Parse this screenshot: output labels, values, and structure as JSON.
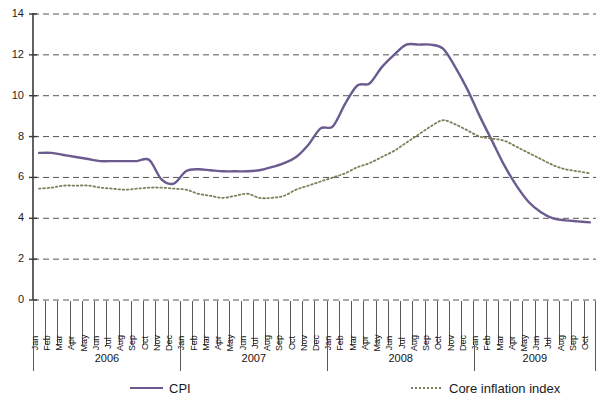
{
  "chart_data": {
    "type": "line",
    "title": "",
    "xlabel": "",
    "ylabel": "",
    "ylim": [
      0,
      14
    ],
    "yticks": [
      0,
      2,
      4,
      6,
      8,
      10,
      12,
      14
    ],
    "grid": true,
    "legend_position": "bottom",
    "months": [
      "Jan",
      "Feb",
      "Mar",
      "Apr",
      "May",
      "Jun",
      "Jul",
      "Aug",
      "Sep",
      "Oct",
      "Nov",
      "Dec"
    ],
    "year_groups": [
      {
        "label": "2006",
        "months": 12
      },
      {
        "label": "2007",
        "months": 12
      },
      {
        "label": "2008",
        "months": 12
      },
      {
        "label": "2009",
        "months": 10
      }
    ],
    "x": [
      "Jan 2006",
      "Feb 2006",
      "Mar 2006",
      "Apr 2006",
      "May 2006",
      "Jun 2006",
      "Jul 2006",
      "Aug 2006",
      "Sep 2006",
      "Oct 2006",
      "Nov 2006",
      "Dec 2006",
      "Jan 2007",
      "Feb 2007",
      "Mar 2007",
      "Apr 2007",
      "May 2007",
      "Jun 2007",
      "Jul 2007",
      "Aug 2007",
      "Sep 2007",
      "Oct 2007",
      "Nov 2007",
      "Dec 2007",
      "Jan 2008",
      "Feb 2008",
      "Mar 2008",
      "Apr 2008",
      "May 2008",
      "Jun 2008",
      "Jul 2008",
      "Aug 2008",
      "Sep 2008",
      "Oct 2008",
      "Nov 2008",
      "Dec 2008",
      "Jan 2009",
      "Feb 2009",
      "Mar 2009",
      "Apr 2009",
      "May 2009",
      "Jun 2009",
      "Jul 2009",
      "Aug 2009",
      "Sep 2009",
      "Oct 2009"
    ],
    "series": [
      {
        "name": "CPI",
        "color": "#6b5b8e",
        "style": "solid",
        "values": [
          7.2,
          7.2,
          7.1,
          7.0,
          6.9,
          6.8,
          6.8,
          6.8,
          6.8,
          6.85,
          5.9,
          5.7,
          6.3,
          6.4,
          6.35,
          6.3,
          6.3,
          6.3,
          6.35,
          6.5,
          6.7,
          7.0,
          7.6,
          8.4,
          8.5,
          9.6,
          10.5,
          10.6,
          11.4,
          12.0,
          12.5,
          12.5,
          12.5,
          12.3,
          11.4,
          10.3,
          9.0,
          7.8,
          6.6,
          5.6,
          4.8,
          4.3,
          4.0,
          3.9,
          3.85,
          3.8
        ]
      },
      {
        "name": "Core inflation index",
        "color": "#7d7f5a",
        "style": "dotted",
        "values": [
          5.45,
          5.5,
          5.6,
          5.6,
          5.6,
          5.5,
          5.45,
          5.4,
          5.45,
          5.5,
          5.5,
          5.45,
          5.4,
          5.2,
          5.1,
          5.0,
          5.1,
          5.2,
          5.0,
          5.0,
          5.1,
          5.4,
          5.6,
          5.8,
          6.0,
          6.2,
          6.5,
          6.7,
          7.0,
          7.3,
          7.7,
          8.1,
          8.5,
          8.8,
          8.6,
          8.3,
          8.0,
          7.9,
          7.8,
          7.5,
          7.2,
          6.9,
          6.6,
          6.4,
          6.3,
          6.2
        ]
      }
    ],
    "legend": [
      {
        "label": "CPI",
        "style": "solid",
        "color": "#6b5b8e"
      },
      {
        "label": "Core inflation index",
        "style": "dotted",
        "color": "#7d7f5a"
      }
    ]
  }
}
